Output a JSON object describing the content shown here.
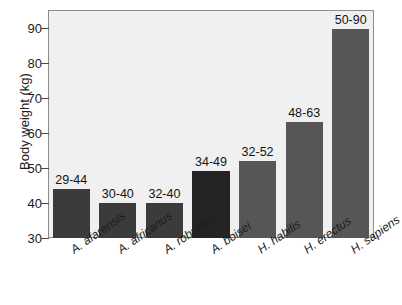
{
  "chart_data": {
    "type": "bar",
    "title": "",
    "xlabel": "",
    "ylabel": "Body weight (kg)",
    "ylim": [
      30,
      95
    ],
    "yticks": [
      30,
      40,
      50,
      60,
      70,
      80,
      90
    ],
    "grid": false,
    "legend": "none",
    "categories": [
      "A. afarensis",
      "A. africanus",
      "A. robustus",
      "A. boisei",
      "H. habilis",
      "H. erectus",
      "H. sapiens"
    ],
    "values": [
      44,
      40,
      40,
      49,
      52,
      63,
      89.5
    ],
    "range_labels": [
      "29-44",
      "30-40",
      "32-40",
      "34-49",
      "32-52",
      "48-63",
      "50-90"
    ],
    "ranges": [
      {
        "min": 29,
        "max": 44
      },
      {
        "min": 30,
        "max": 40
      },
      {
        "min": 32,
        "max": 40
      },
      {
        "min": 34,
        "max": 49
      },
      {
        "min": 32,
        "max": 52
      },
      {
        "min": 48,
        "max": 63
      },
      {
        "min": 50,
        "max": 90
      }
    ],
    "bar_colors": [
      "#3b3b3b",
      "#3b3b3b",
      "#3b3b3b",
      "#242424",
      "#565656",
      "#565656",
      "#565656"
    ],
    "plot_background": "#f0f0f0",
    "frame_color": "#8d8d8d",
    "page_background": "#ffffff",
    "text_color": "#1c1c1c"
  }
}
